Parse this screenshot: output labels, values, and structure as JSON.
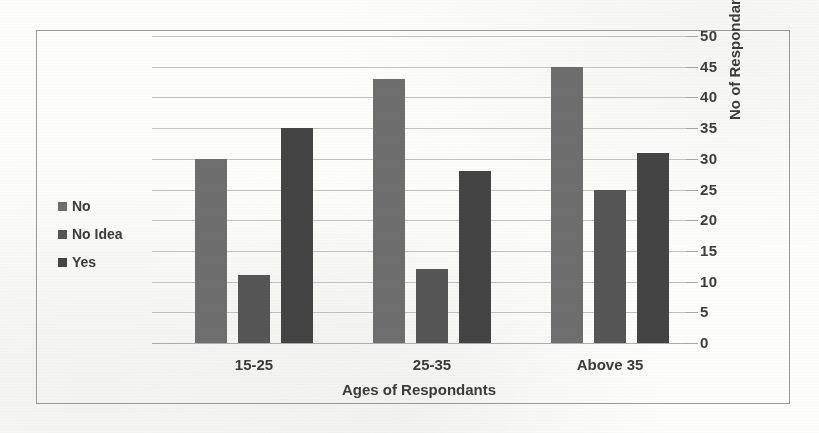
{
  "chart_data": {
    "type": "bar",
    "title": "",
    "subtitle": "",
    "xlabel": "Ages of Respondants",
    "ylabel": "No of Respondants",
    "categories": [
      "15-25",
      "25-35",
      "Above 35"
    ],
    "series": [
      {
        "name": "No",
        "values": [
          30,
          43,
          45
        ],
        "color": "#6e6e6e"
      },
      {
        "name": "No Idea",
        "values": [
          11,
          12,
          25
        ],
        "color": "#565656"
      },
      {
        "name": "Yes",
        "values": [
          35,
          28,
          31
        ],
        "color": "#444444"
      }
    ],
    "ylim": [
      0,
      50
    ],
    "ytick_step": 5,
    "yticks": [
      "0",
      "5",
      "10",
      "15",
      "20",
      "25",
      "30",
      "35",
      "40",
      "45",
      "50"
    ],
    "grid": true,
    "grid_axis": "y",
    "legend_position": "left",
    "y_axis_side": "right",
    "plot_background": "#ffffff",
    "grid_color": "#b9b9b9",
    "frame_color": "#9a9a9a",
    "text_color": "#3b3b3b"
  },
  "legend": {
    "items": [
      {
        "label": "No",
        "color": "#6e6e6e"
      },
      {
        "label": "No Idea",
        "color": "#565656"
      },
      {
        "label": "Yes",
        "color": "#444444"
      }
    ]
  },
  "axes": {
    "x_title": "Ages of Respondants",
    "y_title": "No of Respondants",
    "x_tick_labels": [
      "15-25",
      "25-35",
      "Above 35"
    ],
    "y_tick_labels": [
      "0",
      "5",
      "10",
      "15",
      "20",
      "25",
      "30",
      "35",
      "40",
      "45",
      "50"
    ]
  }
}
